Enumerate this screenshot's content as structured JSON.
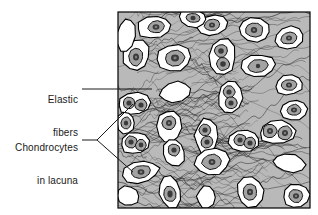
{
  "figure": {
    "tissue_type": "elastic cartilage",
    "frame": {
      "x": 118,
      "y": 12,
      "width": 192,
      "height": 196,
      "border_color": "#000000",
      "border_width": 1
    },
    "colors": {
      "matrix_background": "#b9b9b9",
      "fiber_line": "#2b2b2b",
      "lacuna_fill": "#ffffff",
      "lacuna_outline": "#000000",
      "chondrocyte_fill": "#a3a3a3",
      "chondrocyte_outline": "#111111",
      "nucleus_fill": "#3a3a3a",
      "nucleus_highlight": "#7d7d7d",
      "label_text": "#1a1a1a",
      "leader_line": "#1a1a1a",
      "page_background": "#ffffff"
    }
  },
  "labels": {
    "elastic_fibers": {
      "line1": "Elastic",
      "line2": "fibers"
    },
    "chondrocytes": {
      "line1": "Chondrocytes",
      "line2": "in lacuna"
    }
  },
  "leaders": {
    "elastic_fibers": {
      "type": "straight",
      "from_x": 82,
      "from_y": 89,
      "to_x": 152,
      "to_y": 89
    },
    "chondrocytes": {
      "type": "bracket",
      "stem_from_x": 82,
      "stem_from_y": 140,
      "stem_to_x": 97,
      "stem_to_y": 140,
      "upper_to_x": 133,
      "upper_to_y": 104,
      "lower_to_x": 133,
      "lower_to_y": 172
    }
  },
  "chart_data": {
    "type": "diagram",
    "annotations": [
      "Elastic fibers",
      "Chondrocytes in lacuna"
    ],
    "matrix": {
      "background": "#b9b9b9",
      "fiber_count": 150
    },
    "lacunae": [
      {
        "cx": 154,
        "cy": 27,
        "rx": 17,
        "ry": 11,
        "rot": -8,
        "cells": [
          {
            "dx": 2,
            "dy": 0,
            "rx": 8,
            "ry": 6,
            "rot": -10,
            "nrx": 3.4,
            "nry": 2.8
          }
        ]
      },
      {
        "cx": 136,
        "cy": 55,
        "rx": 13,
        "ry": 16,
        "rot": 10,
        "cells": [
          {
            "dx": 0,
            "dy": 2,
            "rx": 7,
            "ry": 9,
            "rot": 8,
            "nrx": 3,
            "nry": 3.6
          }
        ]
      },
      {
        "cx": 174,
        "cy": 58,
        "rx": 17,
        "ry": 13,
        "rot": -5,
        "cells": [
          {
            "dx": 1,
            "dy": 0,
            "rx": 10,
            "ry": 8,
            "rot": -5,
            "nrx": 4,
            "nry": 3.4
          }
        ]
      },
      {
        "cx": 126,
        "cy": 35,
        "rx": 9,
        "ry": 17,
        "rot": 8,
        "cells": []
      },
      {
        "cx": 175,
        "cy": 92,
        "rx": 16,
        "ry": 10,
        "rot": -12,
        "cells": []
      },
      {
        "cx": 212,
        "cy": 25,
        "rx": 15,
        "ry": 10,
        "rot": -10,
        "cells": [
          {
            "dx": 0,
            "dy": 0,
            "rx": 8,
            "ry": 5.5,
            "rot": -10,
            "nrx": 3,
            "nry": 2.6
          }
        ]
      },
      {
        "cx": 222,
        "cy": 57,
        "rx": 13,
        "ry": 19,
        "rot": 6,
        "cells": [
          {
            "dx": -1,
            "dy": -6,
            "rx": 6.5,
            "ry": 6.5,
            "rot": 0,
            "nrx": 2.8,
            "nry": 2.8
          },
          {
            "dx": 1,
            "dy": 7,
            "rx": 6.5,
            "ry": 6.5,
            "rot": 0,
            "nrx": 2.8,
            "nry": 2.8
          }
        ]
      },
      {
        "cx": 254,
        "cy": 30,
        "rx": 16,
        "ry": 12,
        "rot": 8,
        "cells": [
          {
            "dx": 0,
            "dy": 0,
            "rx": 9,
            "ry": 7,
            "rot": 8,
            "nrx": 3.2,
            "nry": 3
          }
        ]
      },
      {
        "cx": 289,
        "cy": 38,
        "rx": 15,
        "ry": 11,
        "rot": -14,
        "cells": [
          {
            "dx": 0,
            "dy": 0,
            "rx": 8.5,
            "ry": 6,
            "rot": -14,
            "nrx": 3,
            "nry": 2.6
          }
        ]
      },
      {
        "cx": 258,
        "cy": 66,
        "rx": 17,
        "ry": 11,
        "rot": -6,
        "cells": [
          {
            "dx": 0,
            "dy": 0,
            "rx": 10,
            "ry": 6.5,
            "rot": -6,
            "nrx": 2.2,
            "nry": 2.2
          }
        ]
      },
      {
        "cx": 289,
        "cy": 85,
        "rx": 14,
        "ry": 10,
        "rot": -8,
        "cells": [
          {
            "dx": 0,
            "dy": 0,
            "rx": 8,
            "ry": 5.5,
            "rot": -8,
            "nrx": 3,
            "nry": 2.6
          }
        ]
      },
      {
        "cx": 230,
        "cy": 97,
        "rx": 12,
        "ry": 16,
        "rot": 6,
        "cells": [
          {
            "dx": -1,
            "dy": -5,
            "rx": 6,
            "ry": 6,
            "rot": 0,
            "nrx": 2.6,
            "nry": 2.6
          },
          {
            "dx": 1,
            "dy": 6,
            "rx": 6,
            "ry": 6,
            "rot": 0,
            "nrx": 2.6,
            "nry": 2.6
          }
        ]
      },
      {
        "cx": 134,
        "cy": 104,
        "rx": 16,
        "ry": 11,
        "rot": -6,
        "cells": [
          {
            "dx": -5,
            "dy": -1,
            "rx": 6,
            "ry": 6,
            "rot": 0,
            "nrx": 2.6,
            "nry": 2.6
          },
          {
            "dx": 7,
            "dy": 1,
            "rx": 6,
            "ry": 6,
            "rot": 0,
            "nrx": 2.6,
            "nry": 2.6
          }
        ]
      },
      {
        "cx": 135,
        "cy": 143,
        "rx": 14,
        "ry": 11,
        "rot": -10,
        "cells": [
          {
            "dx": -4,
            "dy": -1,
            "rx": 6,
            "ry": 6,
            "rot": 0,
            "nrx": 2.6,
            "nry": 2.6
          },
          {
            "dx": 6,
            "dy": 2,
            "rx": 5.5,
            "ry": 5.5,
            "rot": 0,
            "nrx": 2.4,
            "nry": 2.4
          }
        ]
      },
      {
        "cx": 141,
        "cy": 172,
        "rx": 18,
        "ry": 11,
        "rot": -12,
        "cells": [
          {
            "dx": 0,
            "dy": 0,
            "rx": 10,
            "ry": 6.5,
            "rot": -12,
            "nrx": 3.4,
            "nry": 2.8
          }
        ]
      },
      {
        "cx": 169,
        "cy": 127,
        "rx": 12,
        "ry": 17,
        "rot": 4,
        "cells": [
          {
            "dx": 0,
            "dy": -4,
            "rx": 7,
            "ry": 7,
            "rot": 0,
            "nrx": 3,
            "nry": 3
          }
        ]
      },
      {
        "cx": 174,
        "cy": 153,
        "rx": 11,
        "ry": 14,
        "rot": -6,
        "cells": [
          {
            "dx": 0,
            "dy": -3,
            "rx": 6,
            "ry": 6,
            "rot": 0,
            "nrx": 2.6,
            "nry": 2.6
          }
        ]
      },
      {
        "cx": 206,
        "cy": 136,
        "rx": 11,
        "ry": 17,
        "rot": 4,
        "cells": [
          {
            "dx": -1,
            "dy": -6,
            "rx": 6,
            "ry": 6,
            "rot": 0,
            "nrx": 2.6,
            "nry": 2.6
          },
          {
            "dx": 1,
            "dy": 6,
            "rx": 6,
            "ry": 6,
            "rot": 0,
            "nrx": 2.6,
            "nry": 2.6
          }
        ]
      },
      {
        "cx": 212,
        "cy": 162,
        "rx": 18,
        "ry": 13,
        "rot": -8,
        "cells": [
          {
            "dx": 0,
            "dy": 0,
            "rx": 10,
            "ry": 7.5,
            "rot": -8,
            "nrx": 3.4,
            "nry": 3
          }
        ]
      },
      {
        "cx": 244,
        "cy": 141,
        "rx": 16,
        "ry": 11,
        "rot": -8,
        "cells": [
          {
            "dx": -4,
            "dy": -1,
            "rx": 6,
            "ry": 6,
            "rot": 0,
            "nrx": 2.6,
            "nry": 2.6
          },
          {
            "dx": 6,
            "dy": 2,
            "rx": 6,
            "ry": 6,
            "rot": 0,
            "nrx": 2.6,
            "nry": 2.6
          }
        ]
      },
      {
        "cx": 277,
        "cy": 132,
        "rx": 18,
        "ry": 12,
        "rot": -4,
        "cells": [
          {
            "dx": -7,
            "dy": -1,
            "rx": 7,
            "ry": 7,
            "rot": 0,
            "nrx": 3,
            "nry": 3
          },
          {
            "dx": 8,
            "dy": 1,
            "rx": 7,
            "ry": 7,
            "rot": 0,
            "nrx": 3,
            "nry": 3
          }
        ]
      },
      {
        "cx": 289,
        "cy": 163,
        "rx": 16,
        "ry": 9,
        "rot": 6,
        "cells": []
      },
      {
        "cx": 250,
        "cy": 192,
        "rx": 13,
        "ry": 15,
        "rot": -8,
        "cells": [
          {
            "dx": 0,
            "dy": 0,
            "rx": 7,
            "ry": 8,
            "rot": -8,
            "nrx": 3,
            "nry": 3.2
          }
        ]
      },
      {
        "cx": 206,
        "cy": 197,
        "rx": 9,
        "ry": 11,
        "rot": 4,
        "cells": []
      },
      {
        "cx": 170,
        "cy": 192,
        "rx": 11,
        "ry": 16,
        "rot": -10,
        "cells": [
          {
            "dx": 0,
            "dy": 2,
            "rx": 6,
            "ry": 8,
            "rot": -10,
            "nrx": 2.6,
            "nry": 3.4
          }
        ]
      },
      {
        "cx": 126,
        "cy": 123,
        "rx": 9,
        "ry": 11,
        "rot": 0,
        "cells": [
          {
            "dx": 0,
            "dy": 0,
            "rx": 5,
            "ry": 6,
            "rot": 0,
            "nrx": 2.2,
            "nry": 2.6
          }
        ]
      },
      {
        "cx": 294,
        "cy": 110,
        "rx": 13,
        "ry": 10,
        "rot": -6,
        "cells": [
          {
            "dx": 0,
            "dy": 0,
            "rx": 7,
            "ry": 5.5,
            "rot": -6,
            "nrx": 3,
            "nry": 2.4
          }
        ]
      },
      {
        "cx": 296,
        "cy": 196,
        "rx": 13,
        "ry": 12,
        "rot": -6,
        "cells": [
          {
            "dx": 0,
            "dy": 0,
            "rx": 7,
            "ry": 6.5,
            "rot": -6,
            "nrx": 3,
            "nry": 2.8
          }
        ]
      },
      {
        "cx": 193,
        "cy": 18,
        "rx": 14,
        "ry": 9,
        "rot": 6,
        "cells": [
          {
            "dx": 0,
            "dy": 0,
            "rx": 7,
            "ry": 4.5,
            "rot": 6,
            "nrx": 2.6,
            "nry": 2.2
          }
        ]
      },
      {
        "cx": 128,
        "cy": 196,
        "rx": 11,
        "ry": 10,
        "rot": 0,
        "cells": []
      }
    ]
  }
}
